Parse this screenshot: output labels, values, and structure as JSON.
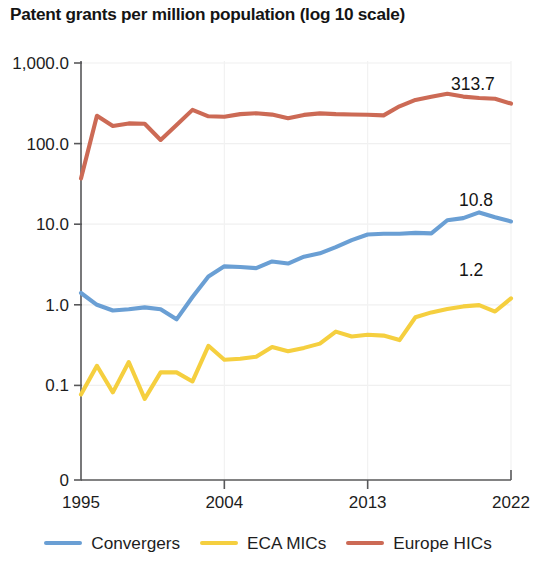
{
  "chart_data": {
    "type": "line",
    "title": "Patent grants per million population (log 10 scale)",
    "xlabel": "",
    "ylabel": "",
    "scale": "log10",
    "grid": true,
    "legend_position": "bottom",
    "x": [
      1995,
      1996,
      1997,
      1998,
      1999,
      2000,
      2001,
      2002,
      2003,
      2004,
      2005,
      2006,
      2007,
      2008,
      2009,
      2010,
      2011,
      2012,
      2013,
      2014,
      2015,
      2016,
      2017,
      2018,
      2019,
      2020,
      2021,
      2022
    ],
    "xlim": [
      1995,
      2022
    ],
    "ylim": [
      0.05,
      1000
    ],
    "ytick_labels": [
      "1,000.0",
      "100.0",
      "10.0",
      "1.0",
      "0.1",
      "0"
    ],
    "ytick_values": [
      1000,
      100,
      10,
      1,
      0.1,
      0
    ],
    "xtick_labels": [
      "1995",
      "2004",
      "2013",
      "2022"
    ],
    "xtick_values": [
      1995,
      2004,
      2013,
      2022
    ],
    "series": [
      {
        "name": "Convergers",
        "color": "#6a9fd4",
        "end_label": "10.8",
        "values": [
          1.4,
          1.0,
          0.85,
          0.88,
          0.93,
          0.88,
          0.66,
          1.25,
          2.25,
          3.0,
          2.95,
          2.85,
          3.45,
          3.25,
          3.95,
          4.35,
          5.2,
          6.35,
          7.45,
          7.6,
          7.6,
          7.8,
          7.7,
          11.2,
          11.9,
          14.0,
          12.2,
          10.8
        ]
      },
      {
        "name": "ECA MICs",
        "color": "#f5cf3f",
        "end_label": "1.2",
        "values": [
          0.077,
          0.175,
          0.082,
          0.195,
          0.068,
          0.145,
          0.145,
          0.112,
          0.31,
          0.208,
          0.214,
          0.227,
          0.3,
          0.265,
          0.292,
          0.33,
          0.465,
          0.405,
          0.425,
          0.415,
          0.365,
          0.7,
          0.805,
          0.885,
          0.955,
          0.99,
          0.825,
          1.2
        ]
      },
      {
        "name": "Europe HICs",
        "color": "#cc6a55",
        "end_label": "313.7",
        "values": [
          37.0,
          221.0,
          165.0,
          178.0,
          176.0,
          111.0,
          170.0,
          262.0,
          218.0,
          215.0,
          232.0,
          238.0,
          229.0,
          206.0,
          227.0,
          237.0,
          232.0,
          230.0,
          228.0,
          224.0,
          290.0,
          348.0,
          382.0,
          416.0,
          383.0,
          368.0,
          360.0,
          313.7
        ]
      }
    ],
    "annotations": [
      {
        "series": "Europe HICs",
        "text": "313.7"
      },
      {
        "series": "Convergers",
        "text": "10.8"
      },
      {
        "series": "ECA MICs",
        "text": "1.2"
      }
    ]
  },
  "legend": {
    "items": [
      {
        "label": "Convergers",
        "color": "#6a9fd4"
      },
      {
        "label": "ECA MICs",
        "color": "#f5cf3f"
      },
      {
        "label": "Europe HICs",
        "color": "#cc6a55"
      }
    ]
  }
}
